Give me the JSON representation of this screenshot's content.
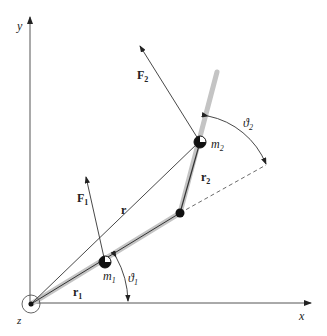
{
  "diagram": {
    "type": "double-pendulum-kinematics",
    "axes": {
      "x_label": "x",
      "y_label": "y",
      "z_label": "z"
    },
    "masses": [
      {
        "label": "m",
        "sub": "1"
      },
      {
        "label": "m",
        "sub": "2"
      }
    ],
    "forces": [
      {
        "label": "F",
        "sub": "1"
      },
      {
        "label": "F",
        "sub": "2"
      }
    ],
    "vectors": {
      "r": "r",
      "r1": {
        "label": "r",
        "sub": "1"
      },
      "r2": {
        "label": "r",
        "sub": "2"
      }
    },
    "angles": [
      {
        "label": "ϑ",
        "sub": "1"
      },
      {
        "label": "ϑ",
        "sub": "2"
      }
    ],
    "colors": {
      "rod": "#b8b8b8",
      "line": "#222222",
      "axis": "#555555"
    }
  }
}
